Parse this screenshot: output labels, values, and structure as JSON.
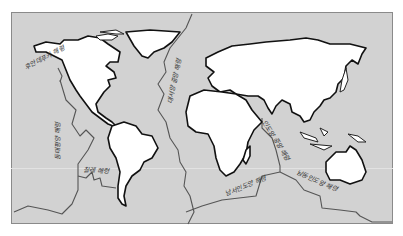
{
  "map": {
    "title": "",
    "background_color": "#d2d2d2",
    "land_color": "#ffffff",
    "ridge_color": "#555555",
    "labels": {
      "juan_de_fuca": "후안데푸카 해령",
      "east_pacific": "동태평양 해령",
      "chile": "칠레 해령",
      "mid_atlantic": "대서양 중앙 해령",
      "central_indian": "인도양 중앙 해령",
      "southwest_indian": "남서인도양 해령",
      "southeast_indian": "남동인도양 해령"
    },
    "continents": [
      "North America",
      "Greenland",
      "South America",
      "Europe",
      "Asia",
      "Africa",
      "Australia",
      "Madagascar",
      "Japan",
      "Indonesia",
      "New Guinea"
    ]
  }
}
